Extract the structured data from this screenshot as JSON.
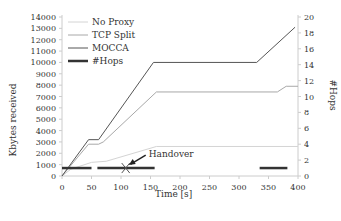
{
  "chart_data": {
    "type": "line",
    "title": "",
    "xlabel": "Time [s]",
    "ylabel": "Kbytes received",
    "y2label": "#Hops",
    "xlim": [
      0,
      400
    ],
    "ylim": [
      0,
      14000
    ],
    "y2lim": [
      0,
      20
    ],
    "xticks": [
      0,
      50,
      100,
      150,
      200,
      250,
      300,
      350,
      400
    ],
    "yticks": [
      0,
      1000,
      2000,
      3000,
      4000,
      5000,
      6000,
      7000,
      8000,
      9000,
      10000,
      11000,
      12000,
      13000,
      14000
    ],
    "y2ticks": [
      0,
      2,
      4,
      6,
      8,
      10,
      12,
      14,
      16,
      18,
      20
    ],
    "grid": false,
    "legend_position": "upper-left",
    "series": [
      {
        "name": "No Proxy",
        "axis": "left",
        "color": "#d4d4d4",
        "width": 1,
        "x": [
          0,
          15,
          50,
          75,
          160,
          400
        ],
        "y": [
          0,
          600,
          1200,
          1300,
          2600,
          2600
        ]
      },
      {
        "name": "TCP Split",
        "axis": "left",
        "color": "#a8a8a8",
        "width": 1,
        "x": [
          0,
          45,
          62,
          70,
          160,
          365,
          380,
          400
        ],
        "y": [
          0,
          2800,
          2800,
          3000,
          7400,
          7400,
          7900,
          7900
        ]
      },
      {
        "name": "MOCCA",
        "axis": "left",
        "color": "#555555",
        "width": 1,
        "x": [
          0,
          45,
          62,
          155,
          330,
          395
        ],
        "y": [
          0,
          3200,
          3200,
          10000,
          10000,
          13100
        ]
      },
      {
        "name": "#Hops",
        "axis": "right",
        "color": "#333333",
        "width": 2.5,
        "segments": [
          [
            0,
            50,
            1
          ],
          [
            60,
            157,
            1
          ],
          [
            335,
            382,
            1
          ]
        ]
      }
    ],
    "annotations": [
      {
        "text": "Handover",
        "x": 108,
        "y2": 1,
        "marker": "x",
        "arrow": true
      }
    ]
  },
  "labels": {
    "xlabel": "Time [s]",
    "ylabel": "Kbytes received",
    "y2label": "#Hops",
    "legend": [
      "No Proxy",
      "TCP Split",
      "MOCCA",
      "#Hops"
    ],
    "annotation": "Handover"
  }
}
